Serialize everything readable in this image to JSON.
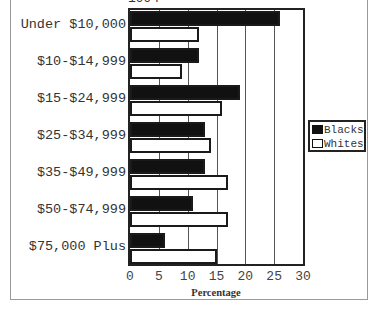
{
  "chart_data": {
    "type": "bar",
    "orientation": "horizontal",
    "title": "1994",
    "xlabel": "Percentage",
    "ylabel": "",
    "xlim": [
      0,
      30
    ],
    "xticks": [
      "0",
      "5",
      "10",
      "15",
      "20",
      "25",
      "30"
    ],
    "grid": "vertical",
    "legend_position": "right",
    "categories": [
      "Under $10,000",
      "$10-$14,999",
      "$15-$24,999",
      "$25-$34,999",
      "$35-$49,999",
      "$50-$74,999",
      "$75,000 Plus"
    ],
    "series": [
      {
        "name": "Blacks",
        "color": "#111111",
        "values": [
          26,
          12,
          19,
          13,
          13,
          11,
          6
        ]
      },
      {
        "name": "Whites",
        "color": "#ffffff",
        "values": [
          12,
          9,
          16,
          14,
          17,
          17,
          15
        ]
      }
    ]
  }
}
